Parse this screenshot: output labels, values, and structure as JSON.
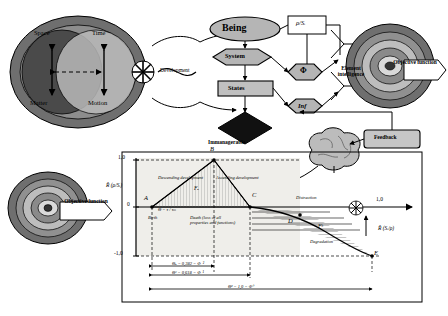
{
  "diagram": {
    "top": {
      "left_disc": {
        "labels": {
          "space": "Space",
          "time": "Time",
          "matter": "Matter",
          "motion": "Motion"
        }
      },
      "development_label": "Development",
      "nodes": {
        "being": "Being",
        "system": "System",
        "states": "States",
        "inf": "Inf",
        "phi": "Φ",
        "ratio_top": "ρ/Sᵢ",
        "element_intelligence": "Element intelligence",
        "objective_function": "Objective function",
        "feedback": "Feedback",
        "immanagerable": "Immanagerable"
      }
    },
    "bottom": {
      "objective_function": "Objective function",
      "axis": {
        "y_label": "R̃ (ρ/Sᵢ)",
        "y_ticks": [
          "1,0",
          "0",
          "-1,0"
        ],
        "x_right_label": "R̃ (Sᵢ/ρ)",
        "x_right_value": "1,0"
      },
      "points": [
        "A",
        "B",
        "C",
        "D",
        "E",
        "F"
      ],
      "curve_labels": {
        "descending": "Descending development",
        "ascending": "Ascending development",
        "distraction": "Distraction",
        "degradation": "Degradation",
        "birth": "Birth",
        "death": "Death (loss of all properties and functions)",
        "f_a": "Fₐ",
        "f_b": "Fᵇ"
      },
      "formulas": {
        "theta_birth": "Θ = τ / τₘ",
        "theta_a": "Θₐ = 0,382 = Φ⁻²",
        "theta_c": "Θᶜ = 0,618 = Φ⁻¹",
        "theta_e": "Θᵉ = 1,0 = Φ⁰",
        "phi_sq": "Φ²"
      }
    }
  },
  "colors": {
    "ink": "#000000",
    "disc_dark": "#4d4d4d",
    "disc_mid": "#8c8c8c",
    "disc_light": "#c9c9c9",
    "node_fill": "#b0b0b0",
    "chart_bg": "#efeeea",
    "hatch": "#9a9a9a",
    "brain": "#b8b8b8"
  }
}
